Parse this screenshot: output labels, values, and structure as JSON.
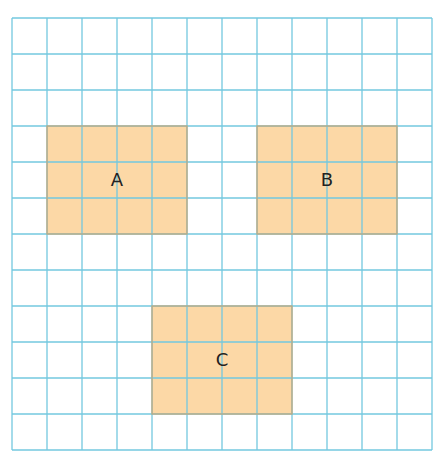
{
  "header": {
    "partial_text": ""
  },
  "grid": {
    "x": 12,
    "y": 18,
    "cols": 12,
    "rows": 12,
    "cell_w": 35,
    "cell_h": 36,
    "line_color": "#73c8df",
    "background": "#ffffff"
  },
  "shapes": {
    "fill": "#fcd8a6",
    "border": "#c9a676",
    "items": [
      {
        "label": "A",
        "col": 1,
        "row": 3,
        "w": 4,
        "h": 3
      },
      {
        "label": "B",
        "col": 7,
        "row": 3,
        "w": 4,
        "h": 3
      },
      {
        "label": "C",
        "col": 4,
        "row": 8,
        "w": 4,
        "h": 3
      }
    ]
  }
}
